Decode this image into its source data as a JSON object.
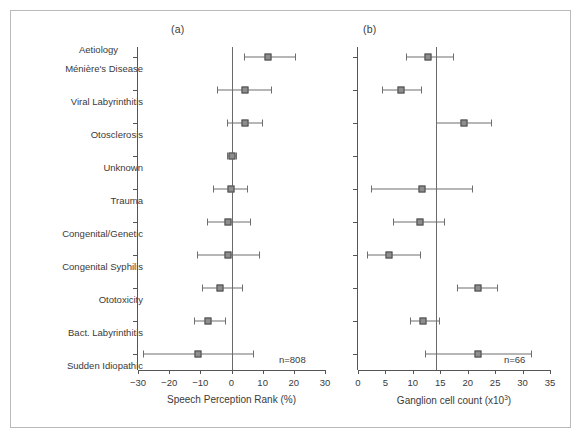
{
  "figure": {
    "panel_a_letter": "(a)",
    "panel_b_letter": "(b)",
    "category_axis_title": "Aetiology",
    "categories": [
      "Ménière's Disease",
      "Viral Labyrinthitis",
      "Otosclerosis",
      "Unknown",
      "Trauma",
      "Congenital/Genetic",
      "Congenital Syphilis",
      "Ototoxicity",
      "Bact. Labyrinthitis",
      "Sudden Idiopathic"
    ],
    "panel_a_n": "n=808",
    "panel_b_n": "n=66",
    "marker_fill": "#8d8d8d",
    "marker_stroke": "#4b4b4b",
    "axis_color": "#555555"
  },
  "chart_data": [
    {
      "type": "scatter",
      "panel": "(a)",
      "title": "",
      "xlabel": "Speech Perception Rank (%)",
      "ylabel": "Aetiology",
      "xlim": [
        -30,
        30
      ],
      "xticks": [
        -30,
        -20,
        -10,
        0,
        10,
        20,
        30
      ],
      "xticklabels": [
        "−30",
        "−20",
        "−10",
        "0",
        "10",
        "20",
        "30"
      ],
      "grid": false,
      "reference_line": 0,
      "n": 808,
      "categories": [
        "Ménière's Disease",
        "Viral Labyrinthitis",
        "Otosclerosis",
        "Unknown",
        "Trauma",
        "Congenital/Genetic",
        "Congenital Syphilis",
        "Ototoxicity",
        "Bact. Labyrinthitis",
        "Sudden Idiopathic"
      ],
      "values": [
        11.6,
        4.2,
        4.2,
        0.0,
        -0.3,
        -1.0,
        -1.0,
        -3.8,
        -7.5,
        -10.8
      ],
      "ci_low": [
        3.9,
        -4.5,
        -1.3,
        -1.6,
        -6.0,
        -8.0,
        -11.0,
        -9.5,
        -12.0,
        -28.5
      ],
      "ci_high": [
        20.3,
        12.6,
        9.7,
        1.6,
        5.0,
        6.0,
        8.7,
        3.3,
        -2.0,
        6.8
      ]
    },
    {
      "type": "scatter",
      "panel": "(b)",
      "title": "",
      "xlabel": "Ganglion cell count (x10³)",
      "xlabel_base": "Ganglion cell count (x10",
      "xlabel_exp": "3",
      "xlabel_tail": ")",
      "ylabel": "Aetiology",
      "xlim": [
        0,
        35
      ],
      "xticks": [
        0,
        5,
        10,
        15,
        20,
        25,
        30,
        35
      ],
      "xticklabels": [
        "0",
        "5",
        "10",
        "15",
        "20",
        "25",
        "30",
        "35"
      ],
      "grid": false,
      "reference_line": 14.2,
      "n": 66,
      "categories": [
        "Ménière's Disease",
        "Viral Labyrinthitis",
        "Otosclerosis",
        "Unknown",
        "Trauma",
        "Congenital/Genetic",
        "Congenital Syphilis",
        "Ototoxicity",
        "Bact. Labyrinthitis",
        "Sudden Idiopathic"
      ],
      "values": [
        12.8,
        7.8,
        19.3,
        null,
        11.7,
        11.3,
        5.6,
        21.8,
        11.8,
        21.8
      ],
      "ci_low": [
        8.8,
        4.3,
        14.3,
        null,
        2.3,
        6.3,
        1.7,
        18.0,
        9.5,
        12.3
      ],
      "ci_high": [
        17.3,
        11.5,
        24.3,
        null,
        20.7,
        15.7,
        11.3,
        25.3,
        14.8,
        31.5
      ]
    }
  ]
}
